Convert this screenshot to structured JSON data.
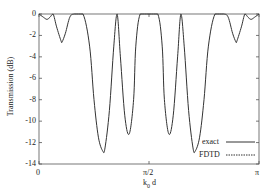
{
  "chart_data": {
    "type": "line",
    "title": "",
    "xlabel": "k0 d",
    "ylabel": "Transmission (dB)",
    "xlim": [
      0,
      3.14159
    ],
    "ylim": [
      -14,
      0
    ],
    "x_tick_labels": [
      "0",
      "π/2",
      "π"
    ],
    "y_tick_labels": [
      "0",
      "-2",
      "-4",
      "-6",
      "-8",
      "-10",
      "-12",
      "-14"
    ],
    "grid": false,
    "legend_position": "lower right",
    "legend": [
      "exact",
      "FDTD"
    ],
    "series": [
      {
        "name": "exact",
        "x_frac_pi": [
          0,
          0.02,
          0.036,
          0.05,
          0.064,
          0.08,
          0.1,
          0.105,
          0.12,
          0.14,
          0.16,
          0.2,
          0.23,
          0.25,
          0.27,
          0.29,
          0.3,
          0.32,
          0.34,
          0.355,
          0.37,
          0.39,
          0.41,
          0.43,
          0.44,
          0.46,
          0.5,
          0.54,
          0.56,
          0.57,
          0.59,
          0.61,
          0.63,
          0.645,
          0.66,
          0.68,
          0.7,
          0.71,
          0.73,
          0.75,
          0.77,
          0.8,
          0.84,
          0.86,
          0.88,
          0.895,
          0.9,
          0.92,
          0.936,
          0.95,
          0.964,
          0.98,
          1.0
        ],
        "y_db": [
          0,
          -0.3,
          -0.5,
          -0.3,
          0,
          -1.2,
          -2.5,
          -2.6,
          -1.8,
          -0.3,
          0,
          0,
          -3,
          -8,
          -11.5,
          -12.8,
          -12.5,
          -9,
          -3,
          0,
          -4,
          -9.5,
          -11.2,
          -8,
          -3,
          0,
          0,
          0,
          -3,
          -8,
          -11.2,
          -9.5,
          -4,
          0,
          -3,
          -9,
          -12.5,
          -12.8,
          -11.5,
          -8,
          -3,
          0,
          0,
          -0.3,
          -1.8,
          -2.6,
          -2.5,
          -1.2,
          0,
          -0.3,
          -0.5,
          -0.3,
          0
        ]
      },
      {
        "name": "FDTD",
        "x_frac_pi": [],
        "y_db": []
      }
    ]
  },
  "axes": {
    "x_ticks": [
      {
        "label": "0"
      },
      {
        "label": "π/2"
      },
      {
        "label": "π"
      }
    ],
    "y_ticks": [
      {
        "label": "0"
      },
      {
        "label": "-2"
      },
      {
        "label": "-4"
      },
      {
        "label": "-6"
      },
      {
        "label": "-8"
      },
      {
        "label": "-10"
      },
      {
        "label": "-12"
      },
      {
        "label": "-14"
      }
    ],
    "xlabel_main": "k",
    "xlabel_sub": "0",
    "xlabel_tail": " d",
    "ylabel": "Transmission (dB)"
  },
  "legend": {
    "items": [
      {
        "label": "exact"
      },
      {
        "label": "FDTD"
      }
    ]
  }
}
